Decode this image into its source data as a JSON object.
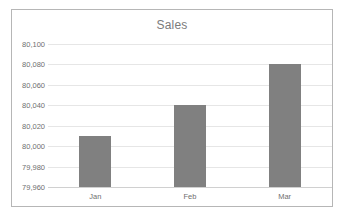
{
  "chart_data": {
    "type": "bar",
    "title": "Sales",
    "categories": [
      "Jan",
      "Feb",
      "Mar"
    ],
    "values": [
      80010,
      80040,
      80080
    ],
    "xlabel": "",
    "ylabel": "",
    "ylim": [
      79960,
      80100
    ],
    "ytick_step": 20,
    "ytick_labels": [
      "80,100",
      "80,080",
      "80,060",
      "80,040",
      "80,020",
      "80,000",
      "79,980",
      "79,960"
    ],
    "ytick_values": [
      80100,
      80080,
      80060,
      80040,
      80020,
      80000,
      79980,
      79960
    ],
    "grid": true,
    "legend": false,
    "bar_color": "#808080",
    "title_color": "#7b7b7b",
    "gridline_color": "#e6e6e6",
    "border_color": "#b6b6b6",
    "plot_background": "#ffffff"
  }
}
